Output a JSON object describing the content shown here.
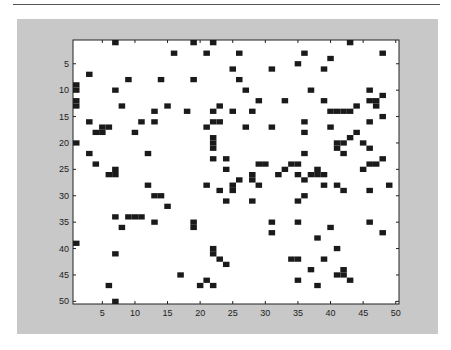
{
  "chart_data": {
    "type": "heatmap",
    "title": "",
    "xlabel": "",
    "ylabel": "",
    "xlim": [
      0.5,
      50.5
    ],
    "ylim": [
      0.5,
      50.5
    ],
    "y_reversed": true,
    "grid": false,
    "colors": {
      "filled": "#1a1a1a",
      "empty": "#ffffff",
      "background": "#c8c8c8"
    },
    "x_ticks": [
      5,
      10,
      15,
      20,
      25,
      30,
      35,
      40,
      45,
      50
    ],
    "y_ticks": [
      5,
      10,
      15,
      20,
      25,
      30,
      35,
      40,
      45,
      50
    ],
    "cells": [
      [
        7,
        1
      ],
      [
        19,
        1
      ],
      [
        22,
        1
      ],
      [
        43,
        1
      ],
      [
        16,
        3
      ],
      [
        21,
        3
      ],
      [
        26,
        3
      ],
      [
        36,
        3
      ],
      [
        48,
        3
      ],
      [
        40,
        4
      ],
      [
        35,
        5
      ],
      [
        25,
        6
      ],
      [
        31,
        6
      ],
      [
        39,
        6
      ],
      [
        3,
        7
      ],
      [
        9,
        8
      ],
      [
        19,
        8
      ],
      [
        14,
        8
      ],
      [
        26,
        8
      ],
      [
        1,
        9
      ],
      [
        1,
        10
      ],
      [
        7,
        10
      ],
      [
        27,
        10
      ],
      [
        37,
        10
      ],
      [
        46,
        10
      ],
      [
        1,
        12
      ],
      [
        1,
        13
      ],
      [
        8,
        13
      ],
      [
        15,
        13
      ],
      [
        29,
        12
      ],
      [
        33,
        12
      ],
      [
        39,
        12
      ],
      [
        23,
        13
      ],
      [
        13,
        14
      ],
      [
        18,
        14
      ],
      [
        22,
        14
      ],
      [
        25,
        14
      ],
      [
        28,
        14
      ],
      [
        40,
        14
      ],
      [
        41,
        14
      ],
      [
        42,
        14
      ],
      [
        43,
        14
      ],
      [
        44,
        13
      ],
      [
        46,
        12
      ],
      [
        47,
        12
      ],
      [
        47,
        13
      ],
      [
        48,
        11
      ],
      [
        48,
        15
      ],
      [
        3,
        16
      ],
      [
        11,
        16
      ],
      [
        13,
        16
      ],
      [
        23,
        16
      ],
      [
        36,
        16
      ],
      [
        36,
        18
      ],
      [
        46,
        16
      ],
      [
        5,
        17
      ],
      [
        6,
        17
      ],
      [
        4,
        18
      ],
      [
        5,
        18
      ],
      [
        10,
        18
      ],
      [
        21,
        17
      ],
      [
        22,
        16
      ],
      [
        27,
        17
      ],
      [
        31,
        17
      ],
      [
        40,
        17
      ],
      [
        1,
        20
      ],
      [
        22,
        19
      ],
      [
        22,
        20
      ],
      [
        22,
        21
      ],
      [
        41,
        20
      ],
      [
        42,
        20
      ],
      [
        43,
        19
      ],
      [
        44,
        18
      ],
      [
        45,
        20
      ],
      [
        46,
        21
      ],
      [
        41,
        21
      ],
      [
        42,
        22
      ],
      [
        3,
        22
      ],
      [
        12,
        22
      ],
      [
        22,
        23
      ],
      [
        24,
        23
      ],
      [
        36,
        22
      ],
      [
        46,
        24
      ],
      [
        47,
        24
      ],
      [
        48,
        23
      ],
      [
        4,
        24
      ],
      [
        7,
        25
      ],
      [
        29,
        24
      ],
      [
        33,
        25
      ],
      [
        30,
        24
      ],
      [
        34,
        24
      ],
      [
        35,
        24
      ],
      [
        24,
        25
      ],
      [
        35,
        26
      ],
      [
        36,
        27
      ],
      [
        38,
        25
      ],
      [
        38,
        26
      ],
      [
        45,
        25
      ],
      [
        6,
        26
      ],
      [
        7,
        26
      ],
      [
        28,
        26
      ],
      [
        32,
        26
      ],
      [
        37,
        26
      ],
      [
        39,
        26
      ],
      [
        12,
        28
      ],
      [
        21,
        28
      ],
      [
        26,
        27
      ],
      [
        28,
        27
      ],
      [
        25,
        28
      ],
      [
        29,
        28
      ],
      [
        39,
        28
      ],
      [
        41,
        28
      ],
      [
        46,
        29
      ],
      [
        49,
        28
      ],
      [
        13,
        30
      ],
      [
        14,
        30
      ],
      [
        23,
        29
      ],
      [
        25,
        29
      ],
      [
        36,
        30
      ],
      [
        42,
        29
      ],
      [
        15,
        32
      ],
      [
        24,
        31
      ],
      [
        28,
        31
      ],
      [
        35,
        31
      ],
      [
        7,
        34
      ],
      [
        9,
        34
      ],
      [
        10,
        34
      ],
      [
        11,
        34
      ],
      [
        13,
        35
      ],
      [
        19,
        35
      ],
      [
        31,
        35
      ],
      [
        35,
        35
      ],
      [
        40,
        36
      ],
      [
        46,
        35
      ],
      [
        8,
        36
      ],
      [
        19,
        36
      ],
      [
        31,
        37
      ],
      [
        38,
        38
      ],
      [
        48,
        37
      ],
      [
        1,
        39
      ],
      [
        22,
        40
      ],
      [
        41,
        40
      ],
      [
        7,
        41
      ],
      [
        22,
        41
      ],
      [
        23,
        42
      ],
      [
        24,
        43
      ],
      [
        34,
        42
      ],
      [
        35,
        42
      ],
      [
        39,
        42
      ],
      [
        42,
        44
      ],
      [
        41,
        45
      ],
      [
        42,
        45
      ],
      [
        43,
        46
      ],
      [
        37,
        44
      ],
      [
        35,
        46
      ],
      [
        17,
        45
      ],
      [
        21,
        46
      ],
      [
        20,
        47
      ],
      [
        22,
        47
      ],
      [
        6,
        47
      ],
      [
        7,
        50
      ],
      [
        38,
        47
      ]
    ]
  }
}
